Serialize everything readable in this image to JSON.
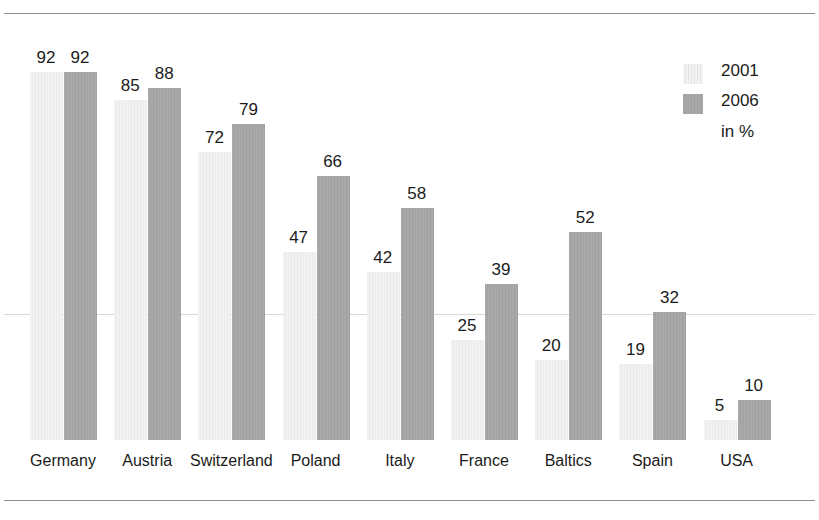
{
  "chart_data": {
    "type": "bar",
    "title": "",
    "subtitle": "",
    "xlabel": "",
    "ylabel": "",
    "unit_note": "in %",
    "categories": [
      "Germany",
      "Austria",
      "Switzerland",
      "Poland",
      "Italy",
      "France",
      "Baltics",
      "Spain",
      "USA"
    ],
    "series": [
      {
        "name": "2001",
        "values": [
          92,
          85,
          72,
          47,
          42,
          25,
          20,
          19,
          5
        ],
        "color": "#f0f0f0"
      },
      {
        "name": "2006",
        "values": [
          92,
          88,
          79,
          66,
          58,
          39,
          52,
          32,
          10
        ],
        "color": "#a6a6a6"
      }
    ],
    "ylim": [
      0,
      100
    ],
    "grid": false,
    "gridlines": [
      31
    ],
    "legend_position": "top-right",
    "data_labels": true
  },
  "legend": {
    "entries": [
      {
        "label": "2001",
        "swatch": "light-hatched-swatch"
      },
      {
        "label": "2006",
        "swatch": "gray-swatch"
      }
    ],
    "unit": "in %"
  },
  "figure": {
    "top_rule": true,
    "bottom_rule": true,
    "background": "#ffffff",
    "label_color": "#1b1b1b",
    "rule_color": "#8e8e8e",
    "midline_color": "#d8d8d8"
  }
}
